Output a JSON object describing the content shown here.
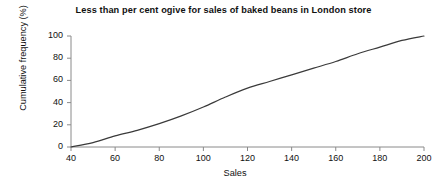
{
  "chart_data": {
    "type": "line",
    "title": "Less than per cent ogive for sales of baked beans in London store",
    "xlabel": "Sales",
    "ylabel": "Cumulative frequency (%)",
    "xlim": [
      40,
      200
    ],
    "ylim": [
      0,
      100
    ],
    "grid": false,
    "legend": null,
    "line_color": "#3a3a3a",
    "axis_color": "#8a8a8a",
    "x_ticks": [
      40,
      60,
      80,
      100,
      120,
      140,
      160,
      180,
      200
    ],
    "y_ticks": [
      0,
      20,
      40,
      60,
      80,
      100
    ],
    "x_tick_labels": [
      "40",
      "60",
      "80",
      "100",
      "120",
      "140",
      "160",
      "180",
      "200"
    ],
    "y_tick_labels": [
      "0",
      "20",
      "40",
      "60",
      "80",
      "100"
    ],
    "series": [
      {
        "name": "Cumulative frequency",
        "x": [
          40,
          50,
          60,
          70,
          80,
          90,
          100,
          110,
          120,
          130,
          140,
          150,
          160,
          170,
          180,
          190,
          200
        ],
        "values": [
          0,
          4,
          10,
          15,
          21,
          28,
          36,
          45,
          53,
          59,
          65,
          71,
          77,
          84,
          90,
          96,
          100
        ]
      }
    ]
  }
}
